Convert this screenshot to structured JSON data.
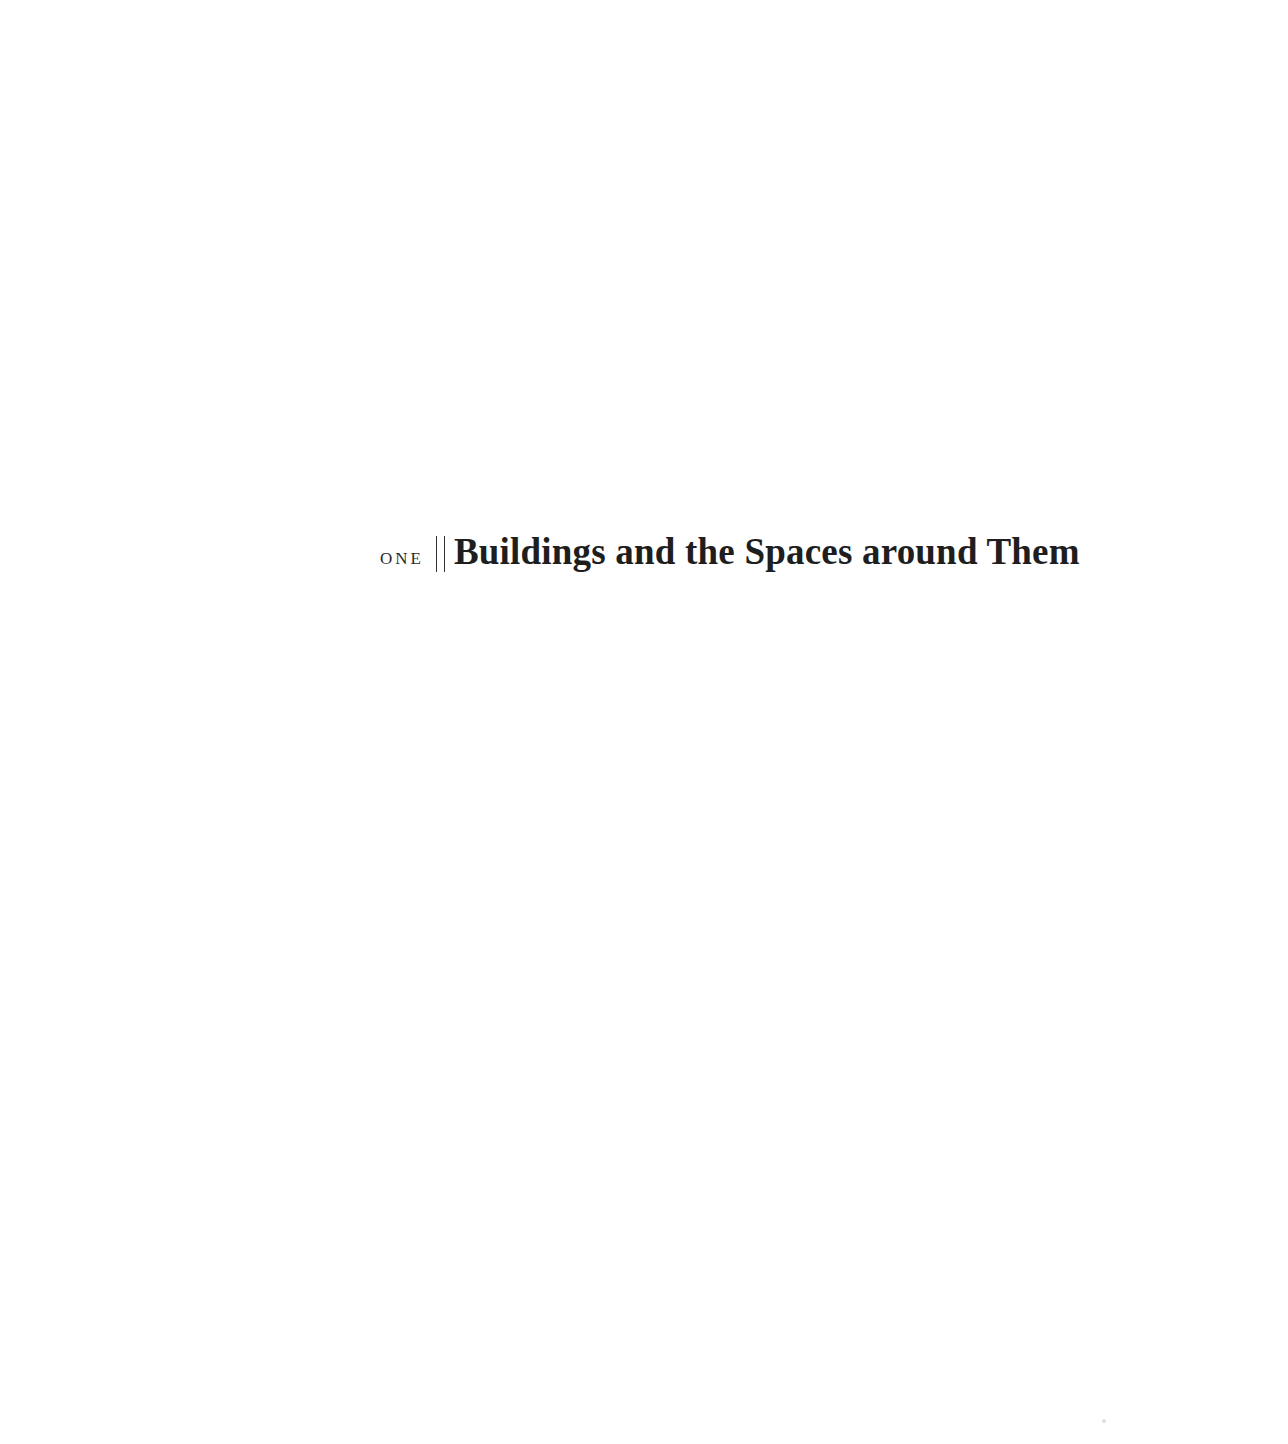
{
  "page": {
    "chapter": {
      "number_label": "one",
      "divider": "||",
      "title": "Buildings and the Spaces around Them"
    }
  }
}
